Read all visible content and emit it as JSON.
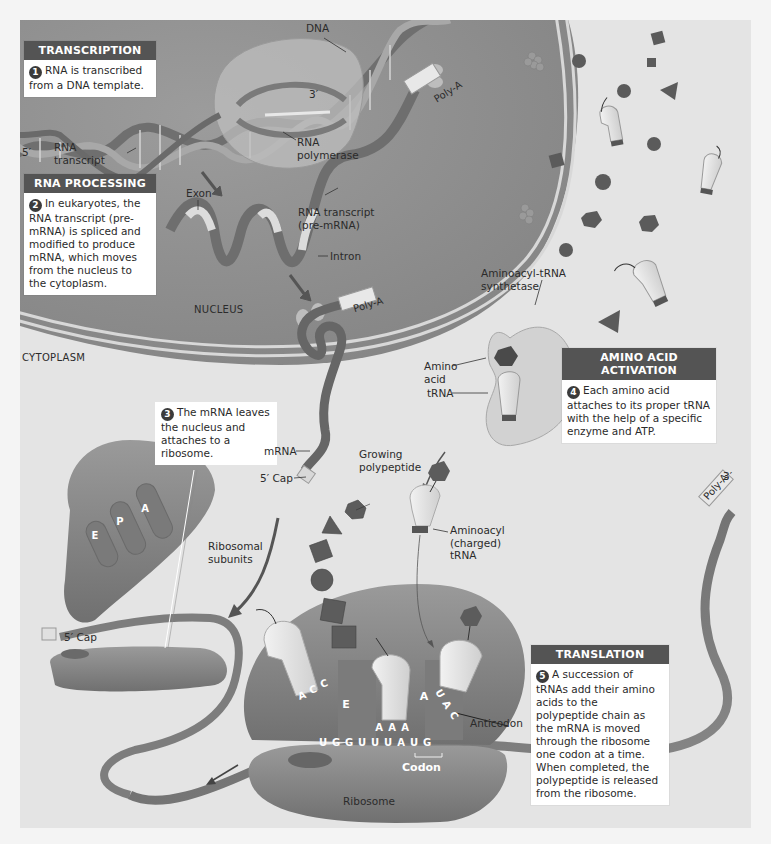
{
  "figure": {
    "colors": {
      "background": "#e4e4e4",
      "nucleus": "#8e8e8e",
      "box_header": "#545454",
      "ribosome": "#8a8a8a",
      "trna": "#e6e6e6",
      "amino_acid": "#5a5a5a"
    }
  },
  "regions": {
    "nucleus": "NUCLEUS",
    "cytoplasm": "CYTOPLASM"
  },
  "steps": [
    {
      "number": "1",
      "title": "TRANSCRIPTION",
      "text": "RNA is transcribed from a DNA template."
    },
    {
      "number": "2",
      "title": "RNA PROCESSING",
      "text": "In eukaryotes, the RNA transcript (pre-mRNA) is spliced and modified to produce mRNA, which moves from the nucleus to the cytoplasm."
    },
    {
      "number": "3",
      "title": "",
      "text": "The mRNA leaves the nucleus and attaches to a ribosome."
    },
    {
      "number": "4",
      "title": "AMINO ACID ACTIVATION",
      "text": "Each amino acid attaches to its proper tRNA with the help of a specific enzyme and ATP."
    },
    {
      "number": "5",
      "title": "TRANSLATION",
      "text": "A succession of tRNAs add their amino acids to the polypeptide chain as the mRNA is moved through the ribosome one codon at a time. When completed, the polypeptide is released from the ribosome."
    }
  ],
  "labels": {
    "dna": "DNA",
    "three_prime_top": "3′",
    "five_prime_left": "5′",
    "rna_transcript": [
      "RNA",
      "transcript"
    ],
    "rna_polymerase": [
      "RNA",
      "polymerase"
    ],
    "poly_a": "Poly-A",
    "exon": "Exon",
    "intron": "Intron",
    "rna_transcript_pre": [
      "RNA transcript",
      "(pre-mRNA)"
    ],
    "aminoacyl_trna_synthetase": [
      "Aminoacyl-tRNA",
      "synthetase"
    ],
    "amino_acid": [
      "Amino",
      "acid"
    ],
    "trna": "tRNA",
    "mrna": "mRNA",
    "five_cap": "5′ Cap",
    "growing_polypeptide": [
      "Growing",
      "polypeptide"
    ],
    "aminoacyl_charged_trna": [
      "Aminoacyl",
      "(charged)",
      "tRNA"
    ],
    "ribosomal_subunits": [
      "Ribosomal",
      "subunits"
    ],
    "site_e": "E",
    "site_p": "P",
    "site_a": "A",
    "anticodon": "Anticodon",
    "codon": "Codon",
    "ribosome": "Ribosome",
    "three_prime_right": "3′"
  },
  "sequences": {
    "mrna_bases": [
      "U",
      "G",
      "G",
      "U",
      "U",
      "U",
      "A",
      "U",
      "G"
    ],
    "trna_e_anticodon": [
      "A",
      "C",
      "C"
    ],
    "trna_p_anticodon": [
      "A",
      "A",
      "A"
    ],
    "trna_a_anticodon": [
      "U",
      "A",
      "C"
    ]
  }
}
